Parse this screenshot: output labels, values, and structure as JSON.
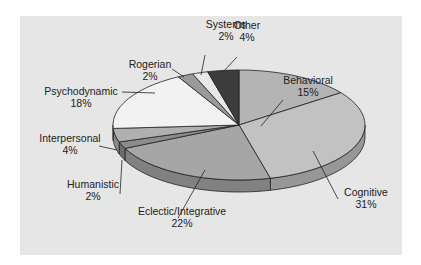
{
  "chart_data": {
    "type": "pie",
    "style": "3d-tilted",
    "title": "",
    "categories": [
      "Behavioral",
      "Cognitive",
      "Eclectic/Integrative",
      "Humanistic",
      "Interpersonal",
      "Psychodynamic",
      "Rogerian",
      "Systems",
      "Other"
    ],
    "values": [
      15,
      31,
      22,
      2,
      4,
      18,
      2,
      2,
      4
    ],
    "unit": "%",
    "start_angle": "12 o'clock",
    "direction": "clockwise",
    "colors": {
      "Behavioral": "#b4b4b4",
      "Cognitive": "#c2c2c2",
      "Eclectic/Integrative": "#a6a6a6",
      "Humanistic": "#8c8c8c",
      "Interpersonal": "#b0b0b0",
      "Psychodynamic": "#f2f2f2",
      "Rogerian": "#9a9a9a",
      "Systems": "#e8e8e8",
      "Other": "#3c3c3c"
    },
    "labels": [
      {
        "name": "Behavioral",
        "pct": "15%"
      },
      {
        "name": "Cognitive",
        "pct": "31%"
      },
      {
        "name": "Eclectic/Integrative",
        "pct": "22%"
      },
      {
        "name": "Humanistic",
        "pct": "2%"
      },
      {
        "name": "Interpersonal",
        "pct": "4%"
      },
      {
        "name": "Psychodynamic",
        "pct": "18%"
      },
      {
        "name": "Rogerian",
        "pct": "2%"
      },
      {
        "name": "Systems",
        "pct": "2%"
      },
      {
        "name": "Other",
        "pct": "4%"
      }
    ],
    "legend": "none (callout labels with leader lines)",
    "background": "#e6e6e6"
  }
}
